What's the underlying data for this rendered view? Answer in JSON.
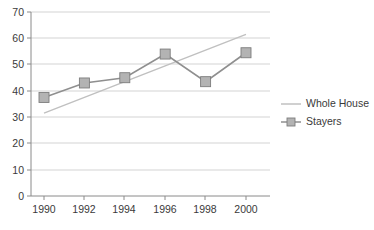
{
  "chart_data": {
    "type": "line",
    "title": "",
    "subtitle": "",
    "xlabel": "",
    "ylabel": "",
    "x": [
      1990,
      1992,
      1994,
      1996,
      1998,
      2000
    ],
    "categories": [
      "1990",
      "1992",
      "1994",
      "1996",
      "1998",
      "2000"
    ],
    "series": [
      {
        "name": "Whole House",
        "type": "trend-line",
        "marker": "none",
        "color": "#c0c0c0",
        "values": [
          31.5,
          37.5,
          43.5,
          49.5,
          55.5,
          61.5
        ]
      },
      {
        "name": "Stayers",
        "type": "line-with-markers",
        "marker": "square",
        "color": "#8f8f8f",
        "values": [
          37.5,
          43,
          45,
          54,
          43.5,
          54.5
        ]
      }
    ],
    "xlim": [
      1989,
      2001
    ],
    "ylim": [
      0,
      70
    ],
    "y_ticks": [
      0,
      10,
      20,
      30,
      40,
      50,
      60,
      70
    ],
    "y_tick_labels": [
      "0",
      "10",
      "20",
      "30",
      "40",
      "50",
      "60",
      "70"
    ],
    "x_ticks": [
      1990,
      1992,
      1994,
      1996,
      1998,
      2000
    ],
    "x_tick_labels": [
      "1990",
      "1992",
      "1994",
      "1996",
      "1998",
      "2000"
    ],
    "grid": {
      "horizontal": true,
      "vertical": false
    },
    "legend": {
      "position": "right",
      "entries": [
        {
          "label": "Whole House",
          "swatch": "line",
          "color": "#c0c0c0"
        },
        {
          "label": "Stayers",
          "swatch": "line-marker",
          "color": "#8f8f8f"
        }
      ]
    }
  },
  "axes": {
    "y_labels": [
      "70",
      "60",
      "50",
      "40",
      "30",
      "20",
      "10",
      "0"
    ],
    "x_labels": [
      "1990",
      "1992",
      "1994",
      "1996",
      "1998",
      "2000"
    ]
  },
  "legend": {
    "whole_house": "Whole House",
    "stayers": "Stayers"
  },
  "colors": {
    "stayers_line": "#8f8f8f",
    "whole_house_line": "#c0c0c0",
    "marker_fill": "#b3b3b3",
    "marker_stroke": "#7d7d7d",
    "gridline": "#c8c8c8",
    "axis": "#8a8a8a",
    "text": "#3a3a3a",
    "background": "#ffffff"
  }
}
